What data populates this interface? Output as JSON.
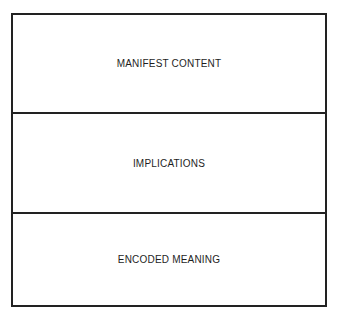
{
  "diagram": {
    "layers": [
      {
        "label": "MANIFEST CONTENT"
      },
      {
        "label": "IMPLICATIONS"
      },
      {
        "label": "ENCODED MEANING"
      }
    ],
    "colors": {
      "line": "#222222",
      "text": "#1e1e1e",
      "background": "#ffffff"
    }
  }
}
